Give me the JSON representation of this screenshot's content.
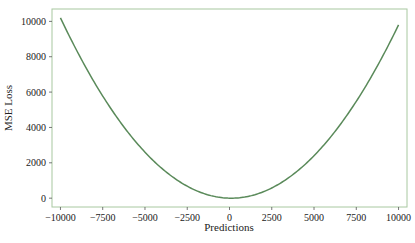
{
  "chart_data": {
    "type": "line",
    "title": "",
    "xlabel": "Predictions",
    "ylabel": "MSE Loss",
    "xlim": [
      -10500,
      10500
    ],
    "ylim": [
      -500,
      10700
    ],
    "grid": false,
    "legend": null,
    "x_ticks": [
      -10000,
      -7500,
      -5000,
      -2500,
      0,
      2500,
      5000,
      7500,
      10000
    ],
    "x_tick_labels": [
      "−10000",
      "−7500",
      "−5000",
      "−2500",
      "0",
      "2500",
      "5000",
      "7500",
      "10000"
    ],
    "y_ticks": [
      0,
      2000,
      4000,
      6000,
      8000,
      10000
    ],
    "y_tick_labels": [
      "0",
      "2000",
      "4000",
      "6000",
      "8000",
      "10000"
    ],
    "series": [
      {
        "name": "MSE Loss",
        "color": "#5a8a5a",
        "x": [
          -10000,
          -7500,
          -5000,
          -2500,
          0,
          100,
          2500,
          5000,
          7500,
          10000
        ],
        "y": [
          10201,
          5776,
          2601,
          676,
          1,
          0,
          576,
          2401,
          5476,
          9801
        ]
      }
    ]
  },
  "colors": {
    "frame": "#a8c8a0",
    "line": "#5a8a5a",
    "text": "#222222"
  }
}
